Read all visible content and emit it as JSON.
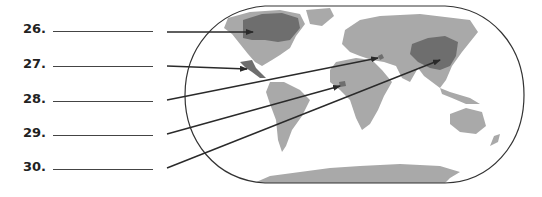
{
  "worksheet": {
    "questions": [
      {
        "number": "26.",
        "answer": "",
        "target": "Canada"
      },
      {
        "number": "27.",
        "answer": "",
        "target": "Mexico"
      },
      {
        "number": "28.",
        "answer": "",
        "target": "Israel"
      },
      {
        "number": "29.",
        "answer": "",
        "target": "Nigeria"
      },
      {
        "number": "30.",
        "answer": "",
        "target": "China"
      }
    ]
  },
  "map": {
    "label": "World map",
    "land_color": "#a9a9a9",
    "highlight_color": "#6e6e6e",
    "outline_color": "#333333",
    "arrow_color": "#2a2a2a"
  }
}
